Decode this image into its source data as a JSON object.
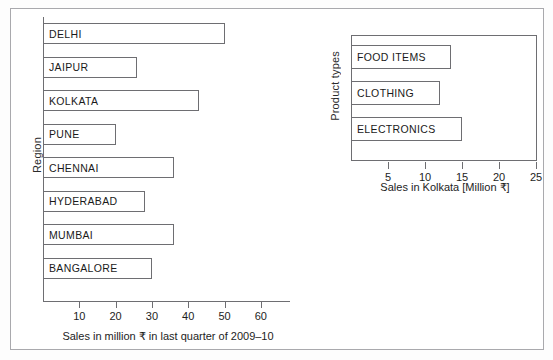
{
  "chart_data": [
    {
      "id": "regional-sales",
      "type": "bar",
      "orientation": "horizontal",
      "title": "",
      "xlabel": "Sales in million ₹ in last quarter of 2009–10",
      "ylabel": "Region",
      "categories": [
        "DELHI",
        "JAIPUR",
        "KOLKATA",
        "PUNE",
        "CHENNAI",
        "HYDERABAD",
        "MUMBAI",
        "BANGALORE"
      ],
      "values": [
        50,
        26,
        43,
        20,
        36,
        28,
        36,
        30
      ],
      "xticks": [
        10,
        20,
        30,
        40,
        50,
        60
      ],
      "xlim": [
        0,
        68
      ],
      "grid": false,
      "legend": "none"
    },
    {
      "id": "kolkata-product-sales",
      "type": "bar",
      "orientation": "horizontal",
      "title": "",
      "xlabel": "Sales in Kolkata [Million ₹]",
      "ylabel": "Product types",
      "categories": [
        "FOOD ITEMS",
        "CLOTHING",
        "ELECTRONICS"
      ],
      "values": [
        13.5,
        12,
        15
      ],
      "xticks": [
        5,
        10,
        15,
        20,
        25
      ],
      "xlim": [
        0,
        25
      ],
      "grid": false,
      "legend": "none"
    }
  ],
  "left_chart": {
    "ylabel": "Region",
    "xtitle": "Sales in million ₹ in last quarter of 2009–10",
    "bars": [
      {
        "label": "DELHI"
      },
      {
        "label": "JAIPUR"
      },
      {
        "label": "KOLKATA"
      },
      {
        "label": "PUNE"
      },
      {
        "label": "CHENNAI"
      },
      {
        "label": "HYDERABAD"
      },
      {
        "label": "MUMBAI"
      },
      {
        "label": "BANGALORE"
      }
    ],
    "ticks": [
      {
        "text": "10"
      },
      {
        "text": "20"
      },
      {
        "text": "30"
      },
      {
        "text": "40"
      },
      {
        "text": "50"
      },
      {
        "text": "60"
      }
    ]
  },
  "right_chart": {
    "ylabel": "Product types",
    "xtitle": "Sales in Kolkata [Million ₹]",
    "bars": [
      {
        "label": "FOOD ITEMS"
      },
      {
        "label": "CLOTHING"
      },
      {
        "label": "ELECTRONICS"
      }
    ],
    "ticks": [
      {
        "text": "5"
      },
      {
        "text": "10"
      },
      {
        "text": "15"
      },
      {
        "text": "20"
      },
      {
        "text": "25"
      }
    ]
  },
  "colors": {
    "bar_stroke": "#6e6e72",
    "bar_fill": "#ffffff",
    "text": "#1a1a1a",
    "frame": "#a9a9ad"
  }
}
